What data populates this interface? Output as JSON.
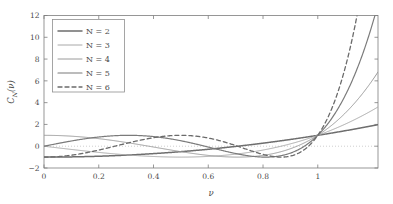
{
  "chart_data": {
    "type": "line",
    "title": "",
    "xlabel": "ν",
    "ylabel": "C_N (ν)",
    "ylabel_base": "C",
    "ylabel_sub": "N",
    "ylabel_arg": "(ν)",
    "xlim": [
      0,
      1.22
    ],
    "ylim": [
      -2,
      12
    ],
    "xticks": [
      0,
      0.2,
      0.4,
      0.6,
      0.8,
      1
    ],
    "xtick_labels": [
      "0",
      "0.2",
      "0.4",
      "0.6",
      "0.8",
      "1"
    ],
    "yticks": [
      -2,
      0,
      2,
      4,
      6,
      8,
      10,
      12
    ],
    "ytick_labels": [
      "−2",
      "0",
      "2",
      "4",
      "6",
      "8",
      "10",
      "12"
    ],
    "grid": false,
    "zero_reference_line": 0,
    "legend_position": "top-left",
    "series": [
      {
        "name": "N = 2",
        "order": 2,
        "color": "#6e6e6e",
        "width": 1.5,
        "dash": "none",
        "formula": "cos(2 arccos v) for v<=1, cosh(2 arccosh v) for v>1",
        "points": [
          [
            0.0,
            -1.0
          ],
          [
            0.1,
            -0.98
          ],
          [
            0.2,
            -0.92
          ],
          [
            0.3,
            -0.82
          ],
          [
            0.4,
            -0.68
          ],
          [
            0.5,
            -0.5
          ],
          [
            0.6,
            -0.28
          ],
          [
            0.7,
            -0.02
          ],
          [
            0.8,
            0.28
          ],
          [
            0.9,
            0.62
          ],
          [
            1.0,
            1.0
          ],
          [
            1.05,
            1.205
          ],
          [
            1.1,
            1.42
          ],
          [
            1.15,
            1.645
          ],
          [
            1.22,
            1.977
          ]
        ]
      },
      {
        "name": "N = 3",
        "order": 3,
        "color": "#a8a8a8",
        "width": 1.0,
        "dash": "none",
        "formula": "cos(3 arccos v) for v<=1, cosh(3 arccosh v) for v>1",
        "points": [
          [
            0.0,
            0.0
          ],
          [
            0.1,
            0.296
          ],
          [
            0.2,
            0.568
          ],
          [
            0.3,
            0.792
          ],
          [
            0.4,
            0.944
          ],
          [
            0.5,
            1.0
          ],
          [
            0.6,
            0.936
          ],
          [
            0.7,
            0.728
          ],
          [
            0.8,
            0.352
          ],
          [
            0.9,
            -0.216
          ],
          [
            1.0,
            1.0
          ],
          [
            1.05,
            1.625
          ],
          [
            1.1,
            2.332
          ],
          [
            1.15,
            3.137
          ],
          [
            1.22,
            4.405
          ]
        ]
      },
      {
        "name": "N = 4",
        "order": 4,
        "color": "#9a9a9a",
        "width": 1.0,
        "dash": "none",
        "formula": "cos(4 arccos v) for v<=1, cosh(4 arccosh v) for v>1",
        "points": [
          [
            0.0,
            1.0
          ],
          [
            0.1,
            0.922
          ],
          [
            0.2,
            0.699
          ],
          [
            0.3,
            0.363
          ],
          [
            0.4,
            -0.018
          ],
          [
            0.5,
            -0.5
          ],
          [
            0.6,
            -0.843
          ],
          [
            0.7,
            -0.995
          ],
          [
            0.8,
            -0.843
          ],
          [
            0.9,
            -0.277
          ],
          [
            1.0,
            1.0
          ],
          [
            1.05,
            1.905
          ],
          [
            1.1,
            3.032
          ],
          [
            1.15,
            4.414
          ],
          [
            1.22,
            6.82
          ]
        ]
      },
      {
        "name": "N = 5",
        "order": 5,
        "color": "#7b7b7b",
        "width": 1.2,
        "dash": "none",
        "formula": "cos(5 arccos v) for v<=1, cosh(5 arccosh v) for v>1",
        "points": [
          [
            0.0,
            0.0
          ],
          [
            0.1,
            0.481
          ],
          [
            0.2,
            0.795
          ],
          [
            0.3,
            0.907
          ],
          [
            0.4,
            0.795
          ],
          [
            0.5,
            0.5
          ],
          [
            0.6,
            0.098
          ],
          [
            0.7,
            -0.318
          ],
          [
            0.8,
            -0.688
          ],
          [
            0.9,
            -0.951
          ],
          [
            1.0,
            1.0
          ],
          [
            1.05,
            2.341
          ],
          [
            1.1,
            4.019
          ],
          [
            1.15,
            6.256
          ],
          [
            1.22,
            10.57
          ]
        ]
      },
      {
        "name": "N = 6",
        "order": 6,
        "color": "#6b6b6b",
        "width": 1.3,
        "dash": "dashed",
        "formula": "cos(6 arccos v) for v<=1, cosh(6 arccosh v) for v>1",
        "points": [
          [
            0.0,
            -1.0
          ],
          [
            0.1,
            -0.7
          ],
          [
            0.2,
            -0.064
          ],
          [
            0.3,
            0.589
          ],
          [
            0.4,
            0.965
          ],
          [
            0.5,
            0.969
          ],
          [
            0.6,
            0.536
          ],
          [
            0.7,
            -0.141
          ],
          [
            0.8,
            -0.745
          ],
          [
            0.9,
            -0.943
          ],
          [
            1.0,
            1.0
          ],
          [
            1.05,
            2.879
          ],
          [
            1.1,
            5.335
          ],
          [
            1.15,
            8.896
          ],
          [
            1.22,
            16.3
          ]
        ]
      }
    ]
  },
  "legend": {
    "entries": [
      {
        "label": "N = 2"
      },
      {
        "label": "N = 3"
      },
      {
        "label": "N = 4"
      },
      {
        "label": "N = 5"
      },
      {
        "label": "N = 6"
      }
    ]
  },
  "colors": {
    "frame": "#7d7d7d",
    "text": "#4a4a4a",
    "zero_line": "#b9b9b9",
    "background": "#ffffff"
  }
}
